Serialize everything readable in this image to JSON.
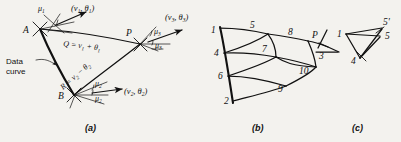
{
  "figure": {
    "background_color": "#f3f2ee",
    "ink_color": "#111111",
    "panels": [
      {
        "id": "a",
        "caption": "(a)"
      },
      {
        "id": "b",
        "caption": "(b)"
      },
      {
        "id": "c",
        "caption": "(c)"
      }
    ]
  },
  "panel_a": {
    "caption": "(a)",
    "points": {
      "A": "A",
      "B": "B",
      "P": "P"
    },
    "annotations": {
      "data_curve_line1": "Data",
      "data_curve_line2": "curve",
      "mu1": "μ",
      "mu1_sub": "1",
      "mu2_upper": "μ",
      "mu2_upper_sub": "2",
      "mu2_lower": "μ",
      "mu2_lower_sub": "2",
      "mu3_upper": "μ",
      "mu3_upper_sub": "3",
      "mu3_lower": "μ",
      "mu3_lower_sub": "3"
    },
    "vectors": [
      {
        "name": "vector-1",
        "open": "(",
        "nu": "ν",
        "nu_sub": "1",
        "comma": ", ",
        "theta": "θ",
        "theta_sub": "1",
        "close": ")"
      },
      {
        "name": "vector-2",
        "open": "(",
        "nu": "ν",
        "nu_sub": "2",
        "comma": ", ",
        "theta": "θ",
        "theta_sub": "2",
        "close": ")"
      },
      {
        "name": "vector-3",
        "open": "(",
        "nu": "ν",
        "nu_sub": "3",
        "comma": ", ",
        "theta": "θ",
        "theta_sub": "3",
        "close": ")"
      }
    ],
    "equations": {
      "Q": {
        "lhs": "Q",
        "eq": " = ",
        "nu": "ν",
        "nu_sub": "1",
        "op": " + ",
        "theta": "θ",
        "theta_sub": "1",
        "full": "Q = ν1 + θ1"
      },
      "R": {
        "lhs": "R",
        "eq": " = ",
        "nu": "ν",
        "nu_sub": "2",
        "op": " − ",
        "theta": "θ",
        "theta_sub": "2",
        "full": "R = ν2 − θ2"
      }
    }
  },
  "panel_b": {
    "caption": "(b)",
    "node_labels": [
      "1",
      "5",
      "8",
      "P",
      "4",
      "7",
      "3",
      "6",
      "10",
      "9",
      "2"
    ],
    "nodes": [
      {
        "label": "1",
        "x": 14,
        "y": 30
      },
      {
        "label": "5",
        "x": 52,
        "y": 27
      },
      {
        "label": "8",
        "x": 88,
        "y": 34
      },
      {
        "label": "P",
        "x": 111,
        "y": 36
      },
      {
        "label": "4",
        "x": 20,
        "y": 51
      },
      {
        "label": "7",
        "x": 64,
        "y": 50
      },
      {
        "label": "3",
        "x": 113,
        "y": 52
      },
      {
        "label": "6",
        "x": 26,
        "y": 72
      },
      {
        "label": "10",
        "x": 96,
        "y": 70
      },
      {
        "label": "9",
        "x": 76,
        "y": 86
      },
      {
        "label": "2",
        "x": 32,
        "y": 99
      }
    ]
  },
  "panel_c": {
    "caption": "(c)",
    "node_labels": [
      "1",
      "4",
      "5",
      "5'"
    ],
    "nodes": [
      {
        "label": "1",
        "x": 8,
        "y": 33
      },
      {
        "label": "5'",
        "x": 54,
        "y": 22
      },
      {
        "label": "5",
        "x": 56,
        "y": 35
      },
      {
        "label": "4",
        "x": 24,
        "y": 57
      }
    ]
  }
}
